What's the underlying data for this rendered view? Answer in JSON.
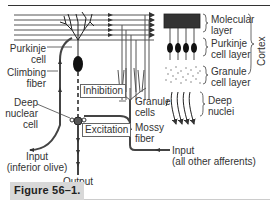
{
  "figure": {
    "caption": "Figure 56–1."
  },
  "labels": {
    "purkinje_cell": [
      "Purkinje",
      "cell"
    ],
    "climbing_fiber": [
      "Climbing",
      "fiber"
    ],
    "deep_nuclear_cell": [
      "Deep",
      "nuclear",
      "cell"
    ],
    "input_inferior_olive": [
      "Input",
      "(inferior olive)"
    ],
    "output": "Output",
    "inhibition": "Inhibition",
    "excitation": "Excitation",
    "granule_cells": [
      "Granule",
      "cells"
    ],
    "mossy_fiber": [
      "Mossy",
      "fiber"
    ],
    "input_other_afferents": [
      "Input",
      "(all other afferents)"
    ]
  },
  "legend": {
    "molecular_layer": [
      "Molecular",
      "layer"
    ],
    "purkinje_cell_layer": [
      "Purkinje",
      "cell layer"
    ],
    "granule_cell_layer": [
      "Granule",
      "cell layer"
    ],
    "deep_nuclei": [
      "Deep",
      "nuclei"
    ],
    "cortex": "Cortex"
  },
  "colors": {
    "line": "#333333",
    "fiber": "#555555",
    "caption_bg": "#d8d8d8"
  }
}
